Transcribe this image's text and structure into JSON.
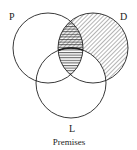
{
  "diagram": {
    "type": "venn",
    "caption": "Premises",
    "circles": [
      {
        "label": "P",
        "cx": 48,
        "cy": 48,
        "r": 35
      },
      {
        "label": "D",
        "cx": 93,
        "cy": 48,
        "r": 35
      },
      {
        "label": "L",
        "cx": 71,
        "cy": 83,
        "r": 35
      }
    ],
    "shading": {
      "diagonal_hatch": "D outside L (and P∩D outside L)",
      "horizontal_hatch": "P∩D",
      "hatch_color": "#333333"
    },
    "stroke_color": "#222222"
  }
}
